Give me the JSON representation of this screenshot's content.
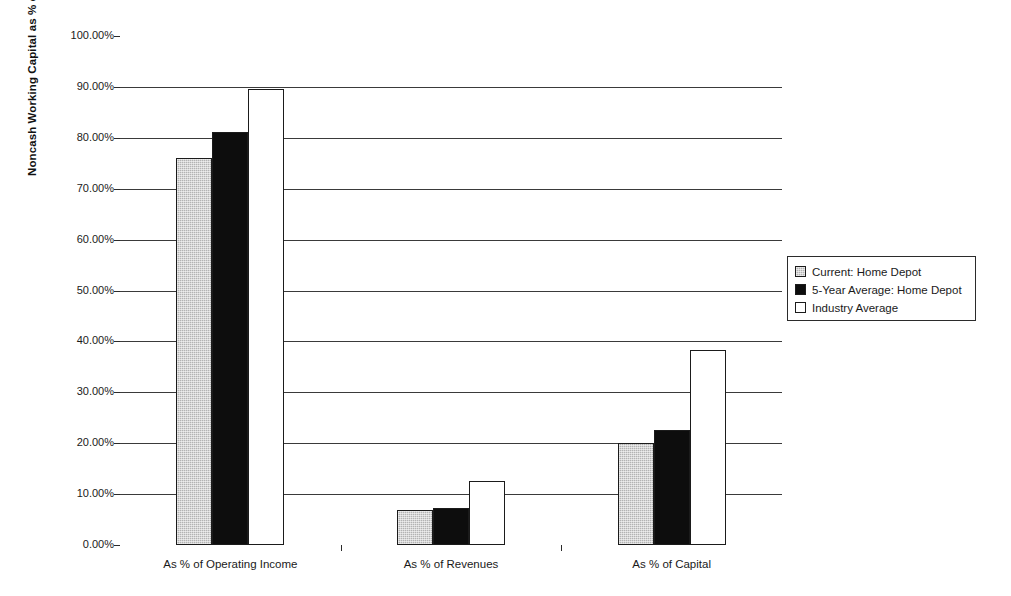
{
  "chart_data": {
    "type": "bar",
    "title": "",
    "subtitle": "",
    "xlabel": "",
    "ylabel": "Noncash Working Capital as % of Revenues",
    "categories": [
      "As % of Operating Income",
      "As % of Revenues",
      "As % of Capital"
    ],
    "series": [
      {
        "name": "Current: Home Depot",
        "color": "#b3b3b3",
        "fill": "gray-hatch",
        "values": [
          76.0,
          6.9,
          20.0
        ]
      },
      {
        "name": "5-Year Average: Home Depot",
        "color": "#0d0d0d",
        "fill": "solid-black",
        "values": [
          81.2,
          7.3,
          22.5
        ]
      },
      {
        "name": "Industry Average",
        "color": "#ffffff",
        "fill": "white",
        "values": [
          89.6,
          12.5,
          38.3
        ]
      }
    ],
    "ylim": [
      0,
      100
    ],
    "ytick_values": [
      0,
      10,
      20,
      30,
      40,
      50,
      60,
      70,
      80,
      90,
      100
    ],
    "ytick_labels": [
      "0.00%",
      "10.00%",
      "20.00%",
      "30.00%",
      "40.00%",
      "50.00%",
      "60.00%",
      "70.00%",
      "80.00%",
      "90.00%",
      "100.00%"
    ],
    "grid": true,
    "grid_axis": "y",
    "legend_position": "right",
    "legend_entries": [
      "Current: Home Depot",
      "5-Year Average: Home Depot",
      "Industry Average"
    ],
    "plot_background": "#ffffff",
    "frame_color": "#2b2b2b"
  }
}
